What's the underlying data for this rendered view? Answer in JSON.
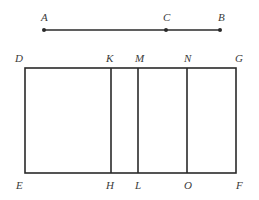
{
  "segment": {
    "y": 30,
    "points": [
      {
        "name": "A",
        "x": 44,
        "label": "A",
        "lx": 41,
        "ly": 21
      },
      {
        "name": "C",
        "x": 166,
        "label": "C",
        "lx": 163,
        "ly": 21
      },
      {
        "name": "B",
        "x": 220,
        "label": "B",
        "lx": 218,
        "ly": 21
      }
    ]
  },
  "rectangle": {
    "left": 25,
    "right": 236,
    "top": 68,
    "bottom": 173,
    "dividers": [
      111,
      138,
      187
    ]
  },
  "labels": {
    "top": [
      {
        "text": "D",
        "x": 15,
        "y": 62
      },
      {
        "text": "K",
        "x": 106,
        "y": 62
      },
      {
        "text": "M",
        "x": 135,
        "y": 62
      },
      {
        "text": "N",
        "x": 184,
        "y": 62
      },
      {
        "text": "G",
        "x": 235,
        "y": 62
      }
    ],
    "bottom": [
      {
        "text": "E",
        "x": 16,
        "y": 189
      },
      {
        "text": "H",
        "x": 106,
        "y": 189
      },
      {
        "text": "L",
        "x": 135,
        "y": 189
      },
      {
        "text": "O",
        "x": 184,
        "y": 189
      },
      {
        "text": "F",
        "x": 236,
        "y": 189
      }
    ]
  },
  "colors": {
    "line": "#2a2a2a",
    "text": "#3a3a3a",
    "background": "#ffffff"
  }
}
